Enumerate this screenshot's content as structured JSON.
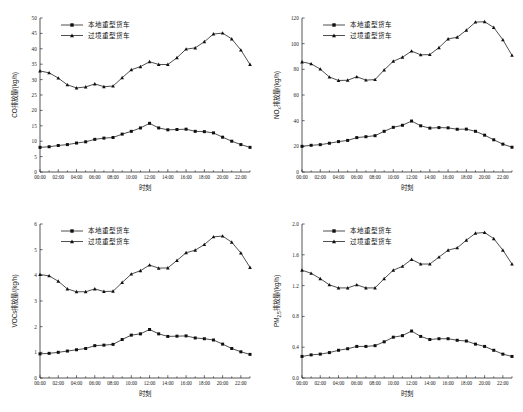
{
  "figure": {
    "panel_count": 4,
    "background_color": "#ffffff",
    "line_color": "#141414"
  },
  "legend": {
    "entries": [
      {
        "label": "本地重型货车",
        "marker": "square-marker-icon"
      },
      {
        "label": "过境重型货车",
        "marker": "triangle-marker-icon"
      }
    ]
  },
  "x_axis": {
    "label": "时刻",
    "tick_labels": [
      "00:00",
      "02:00",
      "04:00",
      "06:00",
      "08:00",
      "10:00",
      "12:00",
      "14:00",
      "16:00",
      "18:00",
      "20:00",
      "22:00"
    ],
    "hours": [
      "00:00",
      "01:00",
      "02:00",
      "03:00",
      "04:00",
      "05:00",
      "06:00",
      "07:00",
      "08:00",
      "09:00",
      "10:00",
      "11:00",
      "12:00",
      "13:00",
      "14:00",
      "15:00",
      "16:00",
      "17:00",
      "18:00",
      "19:00",
      "20:00",
      "21:00",
      "22:00",
      "23:00"
    ]
  },
  "chart_data": [
    {
      "type": "line",
      "panel": "top-left",
      "title": "",
      "xlabel": "时刻",
      "ylabel": "CO排放量/(kg/h)",
      "ylabel_parts": {
        "prefix": "CO",
        "sub": "",
        "suffix": "排放量/(kg/h)"
      },
      "ylim": [
        0,
        50
      ],
      "yticks": [
        0,
        5,
        10,
        15,
        20,
        25,
        30,
        35,
        40,
        45,
        50
      ],
      "ytick_labels": [
        "0",
        "5",
        "10",
        "15",
        "20",
        "25",
        "30",
        "35",
        "40",
        "45",
        "50"
      ],
      "x": [
        "00:00",
        "01:00",
        "02:00",
        "03:00",
        "04:00",
        "05:00",
        "06:00",
        "07:00",
        "08:00",
        "09:00",
        "10:00",
        "11:00",
        "12:00",
        "13:00",
        "14:00",
        "15:00",
        "16:00",
        "17:00",
        "18:00",
        "19:00",
        "20:00",
        "21:00",
        "22:00",
        "23:00"
      ],
      "grid": false,
      "legend_position": "top-left-inside",
      "series": [
        {
          "name": "本地重型货车",
          "marker": "square",
          "values": [
            8.0,
            8.2,
            8.6,
            8.9,
            9.4,
            9.8,
            10.6,
            11.0,
            11.2,
            12.3,
            13.2,
            14.3,
            15.8,
            14.3,
            13.7,
            13.8,
            13.9,
            13.2,
            13.1,
            12.7,
            11.3,
            10.0,
            8.9,
            8.0
          ]
        },
        {
          "name": "过境重型货车",
          "marker": "triangle",
          "values": [
            32.8,
            32.2,
            30.5,
            28.3,
            27.3,
            27.6,
            28.6,
            27.7,
            27.9,
            30.6,
            33.2,
            34.2,
            35.8,
            34.9,
            34.9,
            37.1,
            39.9,
            40.3,
            42.3,
            44.8,
            45.1,
            43.2,
            39.6,
            34.9
          ]
        }
      ]
    },
    {
      "type": "line",
      "panel": "top-right",
      "title": "",
      "xlabel": "时刻",
      "ylabel": "NOx排放量/(kg/h)",
      "ylabel_parts": {
        "prefix": "NO",
        "sub": "x",
        "suffix": "排放量/(kg/h)"
      },
      "ylim": [
        0,
        120
      ],
      "yticks": [
        0,
        20,
        40,
        60,
        80,
        100,
        120
      ],
      "ytick_labels": [
        "0",
        "20",
        "40",
        "60",
        "80",
        "100",
        "120"
      ],
      "x": [
        "00:00",
        "01:00",
        "02:00",
        "03:00",
        "04:00",
        "05:00",
        "06:00",
        "07:00",
        "08:00",
        "09:00",
        "10:00",
        "11:00",
        "12:00",
        "13:00",
        "14:00",
        "15:00",
        "16:00",
        "17:00",
        "18:00",
        "19:00",
        "20:00",
        "21:00",
        "22:00",
        "23:00"
      ],
      "grid": false,
      "legend_position": "top-left-inside",
      "series": [
        {
          "name": "本地重型货车",
          "marker": "square",
          "values": [
            20.0,
            20.8,
            21.3,
            22.4,
            23.7,
            24.6,
            26.8,
            27.5,
            28.3,
            31.7,
            34.8,
            36.4,
            39.7,
            36.0,
            34.2,
            34.6,
            34.4,
            33.3,
            33.4,
            31.7,
            28.7,
            25.1,
            21.7,
            19.3
          ]
        },
        {
          "name": "过境重型货车",
          "marker": "triangle",
          "values": [
            85.8,
            84.3,
            80.2,
            74.0,
            71.3,
            71.5,
            74.2,
            71.6,
            72.0,
            79.5,
            86.3,
            89.4,
            94.2,
            91.3,
            91.5,
            96.9,
            103.7,
            105.0,
            110.5,
            116.8,
            117.1,
            112.6,
            103.0,
            90.9
          ]
        }
      ]
    },
    {
      "type": "line",
      "panel": "bottom-left",
      "title": "",
      "xlabel": "时刻",
      "ylabel": "VOCs排放量/(kg/h)",
      "ylabel_parts": {
        "prefix": "VOCs",
        "sub": "",
        "suffix": "排放量/(kg/h)"
      },
      "ylim": [
        0,
        6
      ],
      "yticks": [
        0,
        1,
        2,
        3,
        4,
        5,
        6
      ],
      "ytick_labels": [
        "0",
        "1",
        "2",
        "3",
        "4",
        "5",
        "6"
      ],
      "x": [
        "00:00",
        "01:00",
        "02:00",
        "03:00",
        "04:00",
        "05:00",
        "06:00",
        "07:00",
        "08:00",
        "09:00",
        "10:00",
        "11:00",
        "12:00",
        "13:00",
        "14:00",
        "15:00",
        "16:00",
        "17:00",
        "18:00",
        "19:00",
        "20:00",
        "21:00",
        "22:00",
        "23:00"
      ],
      "grid": false,
      "legend_position": "top-left-inside",
      "series": [
        {
          "name": "本地重型货车",
          "marker": "square",
          "values": [
            0.94,
            0.96,
            1.0,
            1.05,
            1.1,
            1.15,
            1.26,
            1.28,
            1.31,
            1.5,
            1.67,
            1.72,
            1.89,
            1.72,
            1.62,
            1.63,
            1.64,
            1.56,
            1.53,
            1.48,
            1.32,
            1.15,
            1.02,
            0.92
          ]
        },
        {
          "name": "过境重型货车",
          "marker": "triangle",
          "values": [
            4.03,
            3.98,
            3.77,
            3.47,
            3.36,
            3.36,
            3.47,
            3.37,
            3.38,
            3.72,
            4.05,
            4.18,
            4.4,
            4.28,
            4.29,
            4.58,
            4.88,
            4.98,
            5.2,
            5.5,
            5.53,
            5.29,
            4.87,
            4.31
          ]
        }
      ]
    },
    {
      "type": "line",
      "panel": "bottom-right",
      "title": "",
      "xlabel": "时刻",
      "ylabel": "PM2.5排放量/(kg/h)",
      "ylabel_parts": {
        "prefix": "PM",
        "sub": "2.5",
        "suffix": "排放量/(kg/h)"
      },
      "ylim": [
        0.0,
        2.0
      ],
      "yticks": [
        0.0,
        0.4,
        0.8,
        1.2,
        1.6,
        2.0
      ],
      "ytick_labels": [
        "0.0",
        "0.4",
        "0.8",
        "1.2",
        "1.6",
        "2.0"
      ],
      "x": [
        "00:00",
        "01:00",
        "02:00",
        "03:00",
        "04:00",
        "05:00",
        "06:00",
        "07:00",
        "08:00",
        "09:00",
        "10:00",
        "11:00",
        "12:00",
        "13:00",
        "14:00",
        "15:00",
        "16:00",
        "17:00",
        "18:00",
        "19:00",
        "20:00",
        "21:00",
        "22:00",
        "23:00"
      ],
      "grid": false,
      "legend_position": "top-left-inside",
      "series": [
        {
          "name": "本地重型货车",
          "marker": "square",
          "values": [
            0.28,
            0.3,
            0.31,
            0.33,
            0.36,
            0.38,
            0.41,
            0.41,
            0.42,
            0.47,
            0.53,
            0.55,
            0.61,
            0.54,
            0.5,
            0.51,
            0.51,
            0.49,
            0.48,
            0.44,
            0.41,
            0.36,
            0.31,
            0.28
          ]
        },
        {
          "name": "过境重型货车",
          "marker": "triangle",
          "values": [
            1.4,
            1.36,
            1.29,
            1.21,
            1.17,
            1.17,
            1.21,
            1.17,
            1.17,
            1.29,
            1.4,
            1.45,
            1.54,
            1.48,
            1.48,
            1.57,
            1.66,
            1.69,
            1.79,
            1.88,
            1.89,
            1.81,
            1.66,
            1.48
          ]
        }
      ]
    }
  ]
}
